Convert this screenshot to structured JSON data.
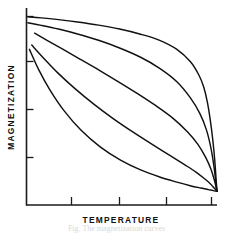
{
  "figure": {
    "kind": "line-plot",
    "background_color": "#ffffff",
    "line_color": "#111111",
    "axis_color": "#1a1a1a"
  },
  "axes": {
    "x_title": "TEMPERATURE",
    "y_title": "MAGNETIZATION",
    "x_tick_count": 4,
    "y_tick_count": 4,
    "x_origin_px": 26,
    "x_end_px": 217,
    "y_origin_px": 205,
    "y_top_px": 8
  },
  "caption": {
    "partial_text": "Fig.  The magnetization curves"
  },
  "chart_data": {
    "type": "line",
    "title": "",
    "xlabel": "TEMPERATURE",
    "ylabel": "MAGNETIZATION",
    "xlim": [
      0,
      1
    ],
    "ylim": [
      0,
      1
    ],
    "grid": false,
    "legend": "none",
    "x_ticks": [
      0.235,
      0.49,
      0.735,
      0.97
    ],
    "y_ticks": [
      0.955,
      0.725,
      0.48,
      0.24
    ],
    "note": "Brillouin-function magnetization vs reduced temperature; five curves for increasing J converging at the Curie point.",
    "series": [
      {
        "name": "curve-1-highest-J",
        "x": [
          0.01,
          0.08,
          0.17,
          0.27,
          0.38,
          0.49,
          0.6,
          0.7,
          0.79,
          0.86,
          0.905,
          0.93,
          0.95,
          0.965,
          0.978,
          0.988,
          0.996,
          1.0
        ],
        "y": [
          0.955,
          0.95,
          0.941,
          0.929,
          0.913,
          0.893,
          0.867,
          0.836,
          0.79,
          0.728,
          0.66,
          0.6,
          0.52,
          0.43,
          0.33,
          0.23,
          0.12,
          0.07
        ]
      },
      {
        "name": "curve-2",
        "x": [
          0.01,
          0.08,
          0.17,
          0.27,
          0.38,
          0.49,
          0.6,
          0.7,
          0.79,
          0.86,
          0.91,
          0.945,
          0.968,
          0.984,
          0.994,
          1.0
        ],
        "y": [
          0.925,
          0.912,
          0.893,
          0.868,
          0.836,
          0.797,
          0.75,
          0.694,
          0.626,
          0.545,
          0.465,
          0.38,
          0.29,
          0.196,
          0.115,
          0.07
        ]
      },
      {
        "name": "curve-3-middle",
        "x": [
          0.045,
          0.11,
          0.19,
          0.28,
          0.38,
          0.48,
          0.58,
          0.68,
          0.77,
          0.845,
          0.9,
          0.94,
          0.968,
          0.986,
          0.995,
          1.0
        ],
        "y": [
          0.872,
          0.836,
          0.792,
          0.742,
          0.686,
          0.628,
          0.568,
          0.504,
          0.44,
          0.372,
          0.308,
          0.243,
          0.183,
          0.127,
          0.09,
          0.07
        ]
      },
      {
        "name": "curve-4",
        "x": [
          0.03,
          0.09,
          0.165,
          0.255,
          0.355,
          0.46,
          0.565,
          0.665,
          0.755,
          0.83,
          0.89,
          0.935,
          0.965,
          0.985,
          0.995,
          1.0
        ],
        "y": [
          0.812,
          0.748,
          0.672,
          0.592,
          0.512,
          0.436,
          0.367,
          0.305,
          0.251,
          0.205,
          0.167,
          0.133,
          0.108,
          0.086,
          0.075,
          0.07
        ]
      },
      {
        "name": "curve-5-lowest-J",
        "x": [
          0.018,
          0.065,
          0.125,
          0.2,
          0.29,
          0.39,
          0.495,
          0.6,
          0.7,
          0.79,
          0.86,
          0.915,
          0.955,
          0.98,
          0.994,
          1.0
        ],
        "y": [
          0.79,
          0.69,
          0.585,
          0.478,
          0.378,
          0.294,
          0.228,
          0.178,
          0.142,
          0.116,
          0.098,
          0.086,
          0.078,
          0.073,
          0.071,
          0.07
        ]
      }
    ]
  }
}
